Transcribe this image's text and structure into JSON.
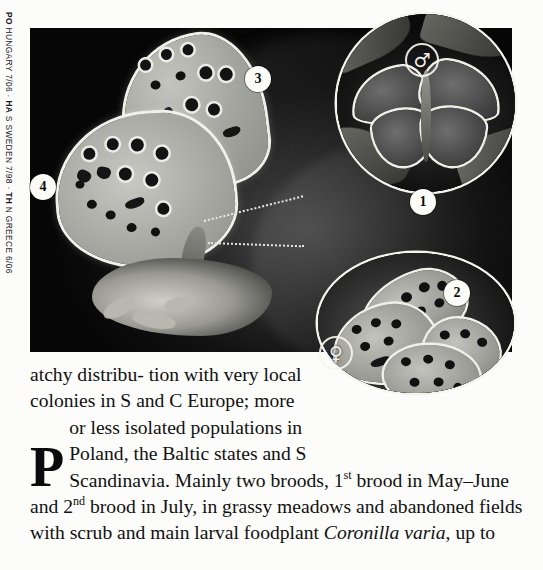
{
  "margin_credit": {
    "full": "PO HUNGARY 7/06 · HA S SWEDEN 7/98 · TH N GREECE 6/06",
    "parts": [
      {
        "code": "PO",
        "detail": " HUNGARY 7/06 · "
      },
      {
        "code": "HA",
        "detail": " S SWEDEN 7/98 · "
      },
      {
        "code": "TH",
        "detail": " N GREECE 6/06"
      }
    ]
  },
  "photo": {
    "main_caption_alt": "Butterfly with closed wings showing spotted underside, perched on plant",
    "markers": [
      {
        "id": "3",
        "label": "3"
      },
      {
        "id": "4",
        "label": "4"
      }
    ]
  },
  "insets": [
    {
      "id": "male-inset",
      "sex_symbol": "♂",
      "sex_name": "male",
      "marker": "1",
      "alt": "Male butterfly with wings spread open, dark upperside"
    },
    {
      "id": "female-inset",
      "sex_symbol": "♀",
      "sex_name": "female",
      "marker": "2",
      "alt": "Female butterfly with wings closed, spotted underside"
    }
  ],
  "text": {
    "dropcap": "P",
    "line1": "atchy distribu-",
    "line2": "tion with very local",
    "rest_before_sup1": "colonies in S and C Europe; more or less isolated populations in Poland, the Baltic states and S Scandinavia. Mainly two broods, 1",
    "sup1": "st",
    "between_sups": " brood in May–June and 2",
    "sup2": "nd",
    "after_sup2": " brood in July, in grassy meadows and abandoned fields with scrub and main larval foodplant ",
    "species_italic": "Coronilla varia",
    "tail": ", up to"
  },
  "colors": {
    "page_background": "#fcfcfa",
    "text": "#111111",
    "photo_background": "#050505",
    "marker_fill": "#fbfbf7"
  }
}
